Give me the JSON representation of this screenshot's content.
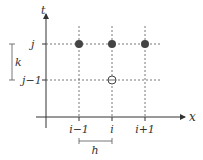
{
  "diagram": {
    "axes": {
      "x_label": "x",
      "y_label": "t"
    },
    "row_labels": [
      "j",
      "j−1"
    ],
    "col_labels": [
      "i−1",
      "i",
      "i+1"
    ],
    "spacing": {
      "time_step": "k",
      "space_step": "h"
    },
    "nodes": [
      {
        "col": "i−1",
        "row": "j",
        "style": "filled"
      },
      {
        "col": "i",
        "row": "j",
        "style": "filled"
      },
      {
        "col": "i+1",
        "row": "j",
        "style": "filled"
      },
      {
        "col": "i",
        "row": "j−1",
        "style": "open-circle-cross"
      }
    ],
    "colors": {
      "line": "#444444",
      "node": "#444444"
    }
  }
}
